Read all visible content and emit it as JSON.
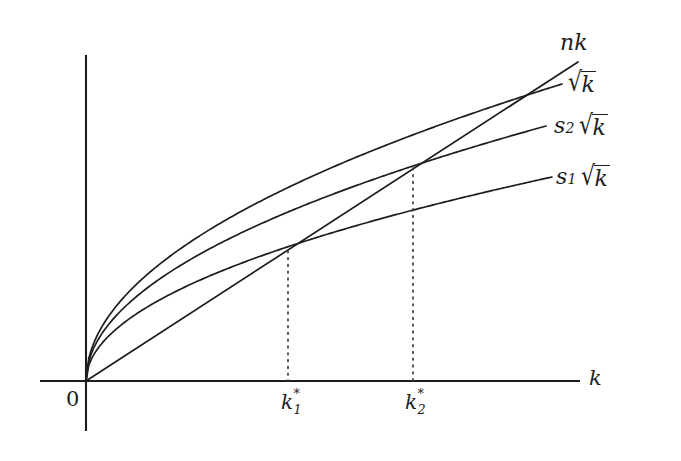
{
  "figure": {
    "kind": "solow-growth-diagram",
    "background_color": "#ffffff",
    "stroke_color": "#1d1d1d"
  },
  "axes": {
    "x_axis_label": "k",
    "origin_label": "0",
    "x_axis": {
      "x_start": 40,
      "x_end": 580,
      "y": 381
    },
    "y_axis": {
      "x": 86,
      "y_top": 55,
      "y_bottom": 431
    }
  },
  "curves": [
    {
      "id": "nk",
      "label": "nk",
      "label_parts": {
        "n": "n",
        "k": "k"
      },
      "type": "line",
      "label_x": 560,
      "label_y": 32,
      "end_x": 578,
      "end_y": 62
    },
    {
      "id": "sqrt_k",
      "label": "√k",
      "label_parts": {
        "radicand": "k"
      },
      "type": "sqrt",
      "coefficient": 1.0,
      "label_x": 568,
      "label_y": 72,
      "end_x": 562,
      "end_y": 84
    },
    {
      "id": "s2_sqrt_k",
      "label": "s2 √k",
      "label_parts": {
        "s": "s",
        "sub": "2",
        "radicand": "k"
      },
      "type": "sqrt",
      "coefficient": 0.74,
      "label_x": 554,
      "label_y": 115,
      "end_x": 546,
      "end_y": 126
    },
    {
      "id": "s1_sqrt_k",
      "label": "s1 √k",
      "label_parts": {
        "s": "s",
        "sub": "1",
        "radicand": "k"
      },
      "type": "sqrt",
      "coefficient": 0.545,
      "label_x": 556,
      "label_y": 166,
      "end_x": 552,
      "end_y": 177
    }
  ],
  "equilibria": [
    {
      "id": "k1",
      "label_base": "k",
      "label_star": "*",
      "label_sub": "1",
      "x": 288,
      "intersect_y": 251,
      "tick_label_x": 281,
      "tick_label_y": 392
    },
    {
      "id": "k2",
      "label_base": "k",
      "label_star": "*",
      "label_sub": "2",
      "x": 413,
      "intersect_y": 168,
      "tick_label_x": 405,
      "tick_label_y": 392
    }
  ],
  "guides": {
    "style": "dotted",
    "color": "#3a3a3a"
  }
}
